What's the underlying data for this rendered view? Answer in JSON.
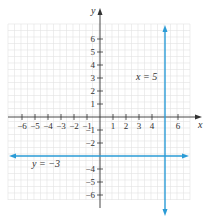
{
  "chart_data": {
    "type": "line",
    "title": "",
    "xlabel": "x",
    "ylabel": "y",
    "xlim": [
      -7,
      7
    ],
    "ylim": [
      -7,
      7
    ],
    "grid": true,
    "x_ticks": [
      -6,
      -5,
      -4,
      -3,
      -2,
      -1,
      1,
      2,
      3,
      4,
      6
    ],
    "y_ticks": [
      -6,
      -5,
      -4,
      -2,
      -1,
      1,
      2,
      3,
      4,
      5,
      6
    ],
    "x_tick_labels": [
      "−6",
      "−5",
      "−4",
      "−3",
      "−2",
      "−1",
      "1",
      "2",
      "3",
      "4",
      "6"
    ],
    "y_tick_labels": [
      "−6",
      "−5",
      "−4",
      "−2",
      "−1",
      "1",
      "2",
      "3",
      "4",
      "5",
      "6"
    ],
    "series": [
      {
        "name": "x = 5",
        "kind": "vertical",
        "value": 5,
        "points": [
          [
            5,
            -7
          ],
          [
            5,
            7
          ]
        ],
        "color": "#2a9bd6",
        "arrows": "both"
      },
      {
        "name": "y = −3",
        "kind": "horizontal",
        "value": -3,
        "points": [
          [
            -7,
            -3
          ],
          [
            7,
            -3
          ]
        ],
        "color": "#2a9bd6",
        "arrows": "both"
      }
    ],
    "annotations": [
      {
        "text": "x = 5",
        "near": [
          3.5,
          3
        ]
      },
      {
        "text": "y = −3",
        "near": [
          -4.5,
          -3.6
        ]
      }
    ]
  },
  "colors": {
    "line": "#2a9bd6",
    "axis": "#333333",
    "grid": "#e2e2e2"
  }
}
